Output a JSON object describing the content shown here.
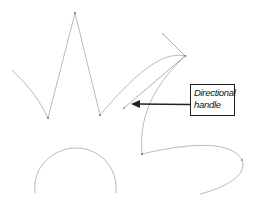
{
  "figure": {
    "type": "vector-path-illustration",
    "colors": {
      "path_stroke": "#a8a8a8",
      "handle_stroke": "#9a9a9a",
      "anchor_fill": "#888888",
      "callout_border": "#222222",
      "arrow": "#222222",
      "background": "#ffffff"
    },
    "callout": {
      "line1": "Directional",
      "line2": "handle"
    },
    "elements": [
      {
        "name": "zigzag-path",
        "description": "Straight-segment path with corner anchor points"
      },
      {
        "name": "curve-path",
        "description": "Smooth curve with directional handles"
      },
      {
        "name": "semicircle-arc",
        "description": "Open arc path"
      },
      {
        "name": "s-curve-path",
        "description": "Curved path ending in an open endpoint"
      }
    ]
  }
}
